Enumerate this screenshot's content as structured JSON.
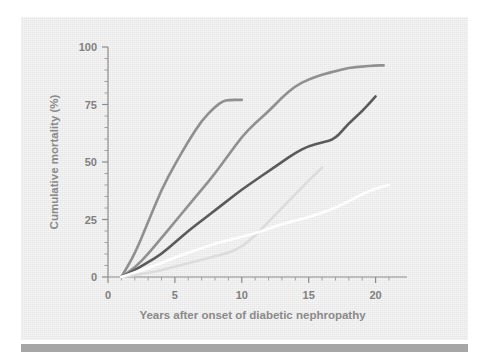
{
  "figure": {
    "background_color": "#ffffff",
    "panel_color": "#ededed",
    "rule_color": "#a6a6a6"
  },
  "chart_data": {
    "type": "line",
    "title": "",
    "xlabel": "Years after onset of diabetic nephropathy",
    "ylabel": "Cumulative mortality (%)",
    "xlim": [
      0,
      21.6
    ],
    "ylim": [
      0,
      100
    ],
    "xticks": [
      0,
      5,
      10,
      15,
      20
    ],
    "xticklabels": [
      "0",
      "5",
      "10",
      "15",
      "20"
    ],
    "xminor_step": 1,
    "yticks": [
      0,
      25,
      50,
      75,
      100
    ],
    "yticklabels": [
      "0",
      "25",
      "50",
      "75",
      "100"
    ],
    "yminor_step": 5,
    "grid": false,
    "legend": "none",
    "axis_color": "#8c8c8c",
    "tick_label_color": "#808080",
    "series": [
      {
        "name": "steepest-cohort",
        "color": "#8f8f8f",
        "width": 2.6,
        "x": [
          1,
          2,
          3,
          4,
          5,
          6,
          7,
          8,
          8.6,
          9,
          10
        ],
        "values": [
          0,
          10,
          24,
          38,
          49,
          59,
          68,
          74,
          76.5,
          77,
          77
        ]
      },
      {
        "name": "second-cohort",
        "color": "#909090",
        "width": 2.6,
        "x": [
          1,
          2,
          3,
          4,
          5,
          6,
          7,
          8,
          9,
          10,
          11,
          12,
          13,
          14,
          15,
          16,
          17,
          18,
          19,
          20,
          20.6
        ],
        "values": [
          0,
          4,
          10,
          17,
          24,
          31,
          38,
          45,
          53,
          61,
          67,
          72,
          78,
          83,
          86,
          88,
          89.5,
          91,
          91.5,
          92,
          92
        ]
      },
      {
        "name": "third-cohort",
        "color": "#5a5a5a",
        "width": 2.6,
        "x": [
          1,
          2,
          3,
          4,
          5,
          6,
          7,
          8,
          9,
          10,
          11,
          12,
          13,
          14,
          15,
          16,
          17,
          18,
          19,
          20
        ],
        "values": [
          0,
          3,
          6.5,
          10,
          15,
          20,
          24.5,
          29,
          33.5,
          38,
          42,
          46,
          50,
          54,
          57,
          58.5,
          60,
          67,
          72,
          78.5
        ]
      },
      {
        "name": "fourth-cohort",
        "color": "#dcdcdc",
        "width": 2.6,
        "x": [
          1,
          2,
          3,
          4,
          5,
          6,
          7,
          8,
          9,
          10,
          11,
          12,
          13,
          14,
          15,
          16
        ],
        "values": [
          0,
          0.8,
          1.8,
          3,
          4.5,
          6,
          7.5,
          9,
          10.5,
          13,
          18,
          24,
          30,
          36,
          42,
          47.5
        ]
      },
      {
        "name": "fifth-cohort",
        "color": "#fdfdfd",
        "width": 2.8,
        "x": [
          1,
          2,
          3,
          4,
          5,
          6,
          7,
          8,
          9,
          10,
          11,
          12,
          13,
          14,
          15,
          16,
          17,
          18,
          19,
          20,
          21
        ],
        "values": [
          0,
          2,
          4,
          6,
          8.5,
          10.5,
          12.5,
          14.5,
          16,
          17.5,
          19,
          21,
          23,
          24.5,
          26,
          28,
          30,
          33,
          36,
          38.5,
          40
        ]
      }
    ]
  }
}
